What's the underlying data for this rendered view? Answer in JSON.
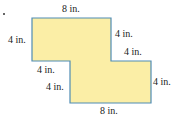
{
  "figure": {
    "type": "composite-shape-dimensions",
    "fill_color": "#fbeea6",
    "stroke_color": "#4f8cb4",
    "labels": {
      "top": "8 in.",
      "left": "4 in.",
      "right_upper_vertical": "4 in.",
      "right_step_horizontal": "4 in.",
      "left_step_horizontal": "4 in.",
      "left_lower_vertical": "4 in.",
      "right_lower_vertical": "4 in.",
      "bottom": "8 in."
    }
  }
}
